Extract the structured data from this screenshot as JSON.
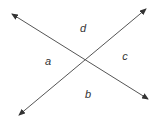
{
  "diagram": {
    "type": "intersecting-lines",
    "line_color": "#444444",
    "label_color": "#333333",
    "lines": [
      {
        "name": "line-nw-se",
        "start": [
          12,
          14
        ],
        "end": [
          148,
          99
        ],
        "arrow_start": true,
        "arrow_end": true
      },
      {
        "name": "line-sw-ne",
        "start": [
          19,
          115
        ],
        "end": [
          146,
          9
        ],
        "arrow_start": true,
        "arrow_end": true
      }
    ],
    "intersection": [
      85,
      59
    ],
    "labels": {
      "top": "d",
      "left": "a",
      "right": "c",
      "bottom": "b"
    }
  }
}
